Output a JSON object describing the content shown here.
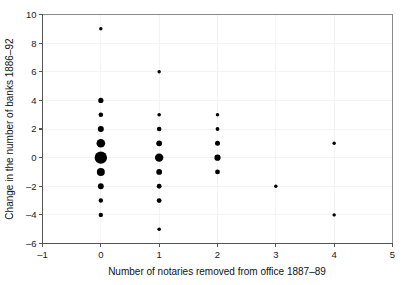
{
  "chart_data": {
    "type": "scatter",
    "title": "",
    "xlabel": "Number of notaries removed from office 1887–89",
    "ylabel": "Change in the number of banks 1886–92",
    "xlim": [
      -1,
      5
    ],
    "ylim": [
      -6,
      10
    ],
    "xticks": [
      -1,
      0,
      1,
      2,
      3,
      4,
      5
    ],
    "xtick_labels": [
      "–1",
      "0",
      "1",
      "2",
      "3",
      "4",
      "5"
    ],
    "yticks": [
      -6,
      -4,
      -2,
      0,
      2,
      4,
      6,
      8,
      10
    ],
    "ytick_labels": [
      "–6",
      "–4",
      "–2",
      "0",
      "2",
      "4",
      "6",
      "8",
      "10"
    ],
    "grid": true,
    "grid_axis": "both",
    "legend": "none",
    "marker": "circle",
    "marker_color": "#000000",
    "size_encodes": "frequency",
    "points": [
      {
        "x": 0,
        "y": 9,
        "r": 1.7
      },
      {
        "x": 0,
        "y": 4,
        "r": 2.6
      },
      {
        "x": 0,
        "y": 3,
        "r": 2.3
      },
      {
        "x": 0,
        "y": 2,
        "r": 3.0
      },
      {
        "x": 0,
        "y": 1,
        "r": 4.3
      },
      {
        "x": 0,
        "y": 0,
        "r": 6.2
      },
      {
        "x": 0,
        "y": -1,
        "r": 4.0
      },
      {
        "x": 0,
        "y": -2,
        "r": 2.9
      },
      {
        "x": 0,
        "y": -3,
        "r": 2.2
      },
      {
        "x": 0,
        "y": -4,
        "r": 2.2
      },
      {
        "x": 1,
        "y": 6,
        "r": 1.7
      },
      {
        "x": 1,
        "y": 3,
        "r": 1.8
      },
      {
        "x": 1,
        "y": 2,
        "r": 2.3
      },
      {
        "x": 1,
        "y": 1,
        "r": 2.9
      },
      {
        "x": 1,
        "y": 0,
        "r": 4.2
      },
      {
        "x": 1,
        "y": -1,
        "r": 2.9
      },
      {
        "x": 1,
        "y": -2,
        "r": 2.4
      },
      {
        "x": 1,
        "y": -3,
        "r": 2.4
      },
      {
        "x": 1,
        "y": -5,
        "r": 1.8
      },
      {
        "x": 2,
        "y": 3,
        "r": 1.7
      },
      {
        "x": 2,
        "y": 2,
        "r": 1.9
      },
      {
        "x": 2,
        "y": 1,
        "r": 2.5
      },
      {
        "x": 2,
        "y": 0,
        "r": 3.1
      },
      {
        "x": 2,
        "y": -1,
        "r": 2.4
      },
      {
        "x": 3,
        "y": -2,
        "r": 1.7
      },
      {
        "x": 4,
        "y": 1,
        "r": 1.7
      },
      {
        "x": 4,
        "y": -4,
        "r": 1.7
      }
    ]
  },
  "colors": {
    "marker": "#000000",
    "axis": "#555555",
    "grid": "#f3f3f3",
    "frame": "#8a8a8a",
    "text": "#111111",
    "background": "#ffffff"
  }
}
